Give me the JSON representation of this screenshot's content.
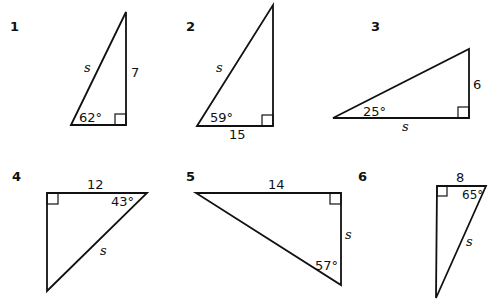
{
  "problems": [
    {
      "number": "1",
      "angle": "62°",
      "side_known": "7",
      "side_unknown": "s",
      "vertices": [
        [
          71,
          125
        ],
        [
          126,
          12
        ],
        [
          126,
          125
        ]
      ],
      "right_angle_at": [
        126,
        125
      ]
    },
    {
      "number": "2",
      "angle": "59°",
      "side_known": "15",
      "side_unknown": "s",
      "vertices": [
        [
          197,
          126
        ],
        [
          273,
          5
        ],
        [
          273,
          126
        ]
      ],
      "right_angle_at": [
        273,
        126
      ]
    },
    {
      "number": "3",
      "angle": "25°",
      "side_known": "6",
      "side_unknown": "s",
      "vertices": [
        [
          333,
          118
        ],
        [
          469,
          49
        ],
        [
          469,
          118
        ]
      ],
      "right_angle_at": [
        469,
        118
      ]
    },
    {
      "number": "4",
      "angle": "43°",
      "side_known": "12",
      "side_unknown": "s",
      "vertices": [
        [
          47,
          193
        ],
        [
          147,
          193
        ],
        [
          47,
          291
        ]
      ],
      "right_angle_at": [
        47,
        193
      ]
    },
    {
      "number": "5",
      "angle": "57°",
      "side_known": "14",
      "side_unknown": "s",
      "vertices": [
        [
          196,
          193
        ],
        [
          341,
          193
        ],
        [
          341,
          285
        ]
      ],
      "right_angle_at": [
        341,
        193
      ]
    },
    {
      "number": "6",
      "angle": "65°",
      "side_known": "8",
      "side_unknown": "s",
      "vertices": [
        [
          437,
          186
        ],
        [
          486,
          186
        ],
        [
          436,
          298
        ]
      ],
      "right_angle_at": [
        437,
        186
      ]
    }
  ]
}
